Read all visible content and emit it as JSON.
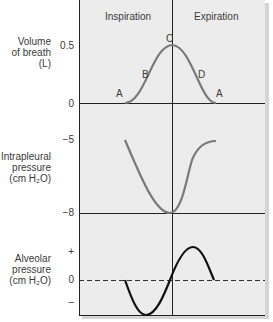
{
  "header": {
    "left": "Inspiration",
    "right": "Expiration"
  },
  "panels": {
    "volume": {
      "label_lines": [
        "Volume",
        "of breath",
        "(L)"
      ],
      "ticks": [
        "0.5",
        "0"
      ],
      "points": {
        "a_left": "A",
        "b": "B",
        "c": "C",
        "d": "D",
        "a_right": "A"
      }
    },
    "intrapleural": {
      "label_lines": [
        "Intrapleural",
        "pressure",
        "(cm H₂O)"
      ],
      "ticks": [
        "−5",
        "−8"
      ]
    },
    "alveolar": {
      "label_lines": [
        "Alveolar",
        "pressure",
        "(cm H₂O)"
      ],
      "ticks": [
        "+",
        "0",
        "–"
      ]
    }
  },
  "colors": {
    "panel_bg": "#ececec",
    "axis": "#222222",
    "curve_gray": "#7a7a7a",
    "curve_black": "#111111"
  }
}
